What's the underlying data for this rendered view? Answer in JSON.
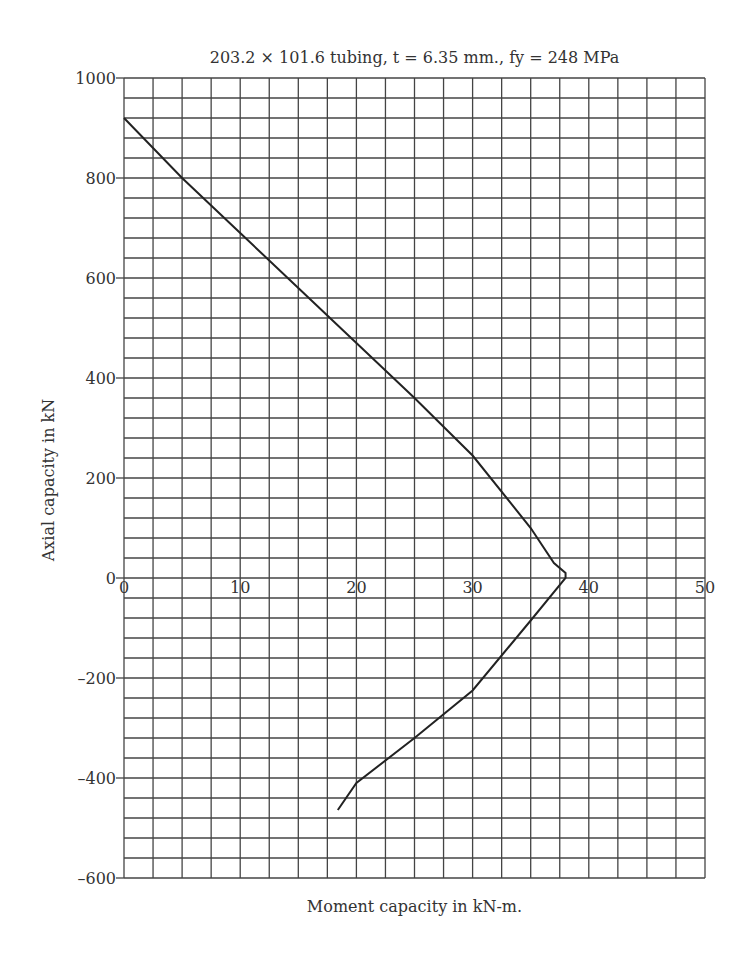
{
  "chart_data": {
    "type": "line",
    "title": "203.2 × 101.6 tubing, t = 6.35 mm., fy = 248 MPa",
    "xlabel": "Moment capacity in kN-m.",
    "ylabel": "Axial capacity in kN",
    "xlim": [
      0,
      50
    ],
    "ylim": [
      -600,
      1000
    ],
    "x_ticks": [
      "0",
      "10",
      "20",
      "30",
      "40",
      "50"
    ],
    "y_ticks": [
      "1000",
      "800",
      "600",
      "400",
      "200",
      "0",
      "-200",
      "-400",
      "-600"
    ],
    "grid": true,
    "grid_x_step": 2.5,
    "grid_y_step": 40,
    "legend": null,
    "series": [
      {
        "name": "Interaction curve",
        "x": [
          0,
          5,
          10,
          15,
          20,
          25,
          30,
          35,
          37,
          38,
          38,
          35,
          30,
          25,
          20,
          18.4
        ],
        "y": [
          920,
          800,
          690,
          580,
          470,
          360,
          245,
          100,
          30,
          10,
          0,
          -85,
          -225,
          -320,
          -410,
          -464
        ]
      }
    ]
  },
  "colors": {
    "line": "#222222",
    "grid": "#444444",
    "text": "#333333"
  }
}
